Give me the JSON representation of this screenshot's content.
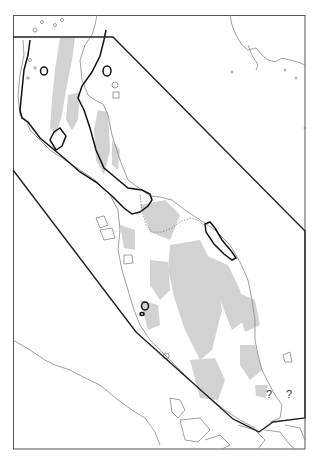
{
  "map": {
    "frame": {
      "x": 13,
      "y": 15,
      "width": 292,
      "height": 434
    },
    "colors": {
      "background": "#ffffff",
      "frame": "#555555",
      "coastline": "#888888",
      "highland": "#d0d0d0",
      "range_outline": "#111111",
      "boundary_polygon": "#222222"
    },
    "labels": {
      "uncertain_1": "?",
      "uncertain_2": "?"
    },
    "features": [
      "coastline",
      "highland-shading",
      "political-border-dotted",
      "range-outline-thick",
      "study-area-polygon",
      "islands"
    ]
  }
}
